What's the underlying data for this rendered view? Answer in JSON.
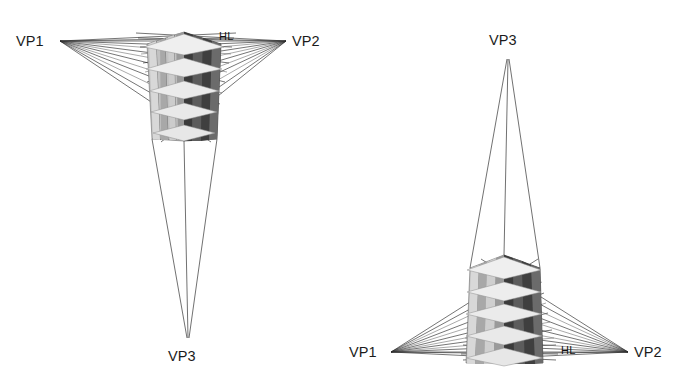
{
  "figure": {
    "background_color": "#ffffff",
    "line_color": "#2a2a2a",
    "text_color": "#1b1b1b"
  },
  "panels": [
    {
      "id": "worms-eye",
      "name": "worm-eye-view",
      "description": "Three-point perspective looking up, third vanishing point below the horizon line",
      "labels": {
        "vp1": "VP1",
        "vp2": "VP2",
        "vp3": "VP3",
        "hl": "HL"
      },
      "points": {
        "vp1": {
          "x": 60,
          "y": 41
        },
        "vp2": {
          "x": 286,
          "y": 41
        },
        "vp3": {
          "x": 188,
          "y": 340
        }
      },
      "label_positions": {
        "vp1": {
          "x": 16,
          "y": 46
        },
        "vp2": {
          "x": 292,
          "y": 46
        },
        "vp3": {
          "x": 168,
          "y": 361
        },
        "hl": {
          "x": 219,
          "y": 40
        }
      },
      "tower": {
        "corner_x": 184,
        "top_y": 32,
        "bottom_y": 141,
        "stories": 5,
        "columns_per_face": 4,
        "left_face_fill": "#b9b9b9",
        "right_face_fill": "#4a4a4a",
        "slab_fill": "#e8e8e8"
      },
      "ray_count": 12
    },
    {
      "id": "birds-eye",
      "name": "bird-eye-view",
      "description": "Three-point perspective looking down, third vanishing point above the horizon line",
      "labels": {
        "vp1": "VP1",
        "vp2": "VP2",
        "vp3": "VP3",
        "hl": "HL"
      },
      "points": {
        "vp1": {
          "x": 391,
          "y": 352
        },
        "vp2": {
          "x": 628,
          "y": 352
        },
        "vp3": {
          "x": 508,
          "y": 57
        }
      },
      "label_positions": {
        "vp1": {
          "x": 349,
          "y": 357
        },
        "vp2": {
          "x": 634,
          "y": 357
        },
        "vp3": {
          "x": 489,
          "y": 45
        },
        "hl": {
          "x": 561,
          "y": 354
        }
      },
      "tower": {
        "corner_x": 504,
        "top_y": 255,
        "bottom_y": 363,
        "stories": 5,
        "columns_per_face": 4,
        "left_face_fill": "#b9b9b9",
        "right_face_fill": "#4a4a4a",
        "slab_fill": "#e8e8e8"
      },
      "ray_count": 12
    }
  ]
}
